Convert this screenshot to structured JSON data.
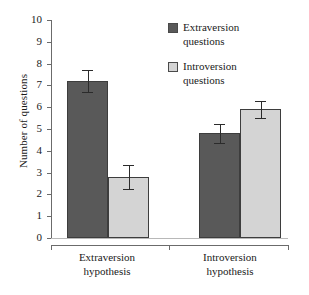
{
  "chart_data": {
    "type": "bar",
    "title": "",
    "xlabel": "",
    "ylabel": "Number of questions",
    "ylim": [
      0,
      10
    ],
    "ytick_labels": [
      "10",
      "9",
      "8",
      "7",
      "6",
      "5",
      "4",
      "3",
      "2",
      "1",
      "0"
    ],
    "grid": false,
    "legend_position": "top-right",
    "categories": [
      "Extraversion hypothesis",
      "Introversion hypothesis"
    ],
    "category_lines": [
      [
        "Extraversion",
        "hypothesis"
      ],
      [
        "Introversion",
        "hypothesis"
      ]
    ],
    "series": [
      {
        "name": "Extraversion questions",
        "name_lines": [
          "Extraversion",
          "questions"
        ],
        "color": "#595959",
        "values": [
          7.2,
          4.8
        ],
        "errors": [
          0.5,
          0.45
        ]
      },
      {
        "name": "Introversion questions",
        "name_lines": [
          "Introversion",
          "questions"
        ],
        "color": "#d4d4d4",
        "values": [
          2.8,
          5.9
        ],
        "errors": [
          0.55,
          0.4
        ]
      }
    ]
  },
  "axis": {
    "y_title": "Number of questions"
  },
  "legend": {
    "entries": [
      {
        "line1": "Extraversion",
        "line2": "questions"
      },
      {
        "line1": "Introversion",
        "line2": "questions"
      }
    ]
  },
  "x_labels": [
    {
      "line1": "Extraversion",
      "line2": "hypothesis"
    },
    {
      "line1": "Introversion",
      "line2": "hypothesis"
    }
  ],
  "y_ticks": [
    "10",
    "9",
    "8",
    "7",
    "6",
    "5",
    "4",
    "3",
    "2",
    "1",
    "0"
  ],
  "colors": {
    "series_dark": "#595959",
    "series_light": "#d4d4d4",
    "axis": "#6b6b6b",
    "error_bar": "#2b2b2b",
    "text": "#1a1a1a"
  }
}
